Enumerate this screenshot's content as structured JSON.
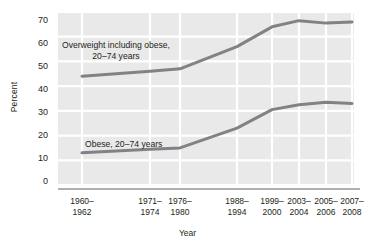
{
  "chart_data": {
    "type": "line",
    "title": "",
    "xlabel": "Year",
    "ylabel": "Percent",
    "ylim": [
      0,
      70
    ],
    "yticks": [
      0,
      10,
      20,
      30,
      40,
      50,
      60,
      70
    ],
    "grid": true,
    "legend_position": "inline-annotation",
    "categories": [
      "1960–1962",
      "1971–1974",
      "1976–1980",
      "1988–1994",
      "1999–2000",
      "2003–2004",
      "2005–2006",
      "2007–2008"
    ],
    "category_lines": [
      {
        "l1": "1960–",
        "l2": "1962"
      },
      {
        "l1": "1971–",
        "l2": "1974"
      },
      {
        "l1": "1976–",
        "l2": "1980"
      },
      {
        "l1": "1988–",
        "l2": "1994"
      },
      {
        "l1": "1999–",
        "l2": "2000"
      },
      {
        "l1": "2003–",
        "l2": "2004"
      },
      {
        "l1": "2005–",
        "l2": "2006"
      },
      {
        "l1": "2007–",
        "l2": "2008"
      }
    ],
    "x_positions_px": [
      82,
      150,
      180,
      237,
      272,
      299,
      326,
      352
    ],
    "series": [
      {
        "name": "Overweight including obese, 20–74 years",
        "label_line1": "Overweight including obese,",
        "label_line2": "20–74 years",
        "color": "#808285",
        "values": [
          44.0,
          46.0,
          47.0,
          56.0,
          64.0,
          66.5,
          65.5,
          66.0
        ]
      },
      {
        "name": "Obese, 20–74 years",
        "label_line1": "Obese, 20–74 years",
        "label_line2": "",
        "color": "#808285",
        "values": [
          13.0,
          14.5,
          15.0,
          23.0,
          30.5,
          32.5,
          33.5,
          33.0
        ]
      }
    ],
    "colors": {
      "line": "#808285",
      "plot_background": "#e9e9e9",
      "gridline": "#ffffff",
      "axis": "#939598",
      "text": "#231f20"
    }
  }
}
